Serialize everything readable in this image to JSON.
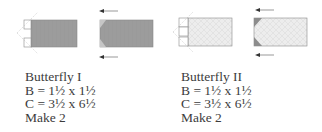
{
  "diagram": {
    "colors": {
      "dark_fabric": "#9a9a9a",
      "light_fabric": "#ececec",
      "outline": "#8a8a8a",
      "triangle": "#8c8c8c",
      "arrow": "#555555"
    },
    "units": [
      {
        "name": "Butterfly I",
        "fabric_b_label": "B = 1½ x 1½",
        "fabric_c_label": "C = 3½ x 6½",
        "quantity_label": "Make 2",
        "fabric_c_shade": "dark"
      },
      {
        "name": "Butterfly II",
        "fabric_b_label": "B = 1½ x 1½",
        "fabric_c_label": "C = 3½ x 6½",
        "quantity_label": "Make 2",
        "fabric_c_shade": "light"
      }
    ],
    "arrows": {
      "direction": "left",
      "count_per_unit": 2
    }
  }
}
